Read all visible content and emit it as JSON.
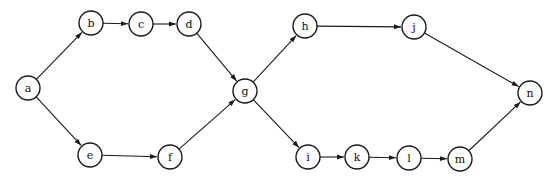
{
  "diagram": {
    "type": "directed-graph",
    "node_radius": 12,
    "nodes": [
      {
        "id": "a",
        "label": "a",
        "x": 28,
        "y": 88
      },
      {
        "id": "b",
        "label": "b",
        "x": 91,
        "y": 23
      },
      {
        "id": "c",
        "label": "c",
        "x": 141,
        "y": 24
      },
      {
        "id": "d",
        "label": "d",
        "x": 189,
        "y": 24
      },
      {
        "id": "e",
        "label": "e",
        "x": 90,
        "y": 155
      },
      {
        "id": "f",
        "label": "f",
        "x": 170,
        "y": 157
      },
      {
        "id": "g",
        "label": "g",
        "x": 245,
        "y": 91
      },
      {
        "id": "h",
        "label": "h",
        "x": 305,
        "y": 26
      },
      {
        "id": "j",
        "label": "j",
        "x": 414,
        "y": 27
      },
      {
        "id": "n",
        "label": "n",
        "x": 530,
        "y": 93
      },
      {
        "id": "i",
        "label": "i",
        "x": 308,
        "y": 157
      },
      {
        "id": "k",
        "label": "k",
        "x": 357,
        "y": 157
      },
      {
        "id": "l",
        "label": "l",
        "x": 409,
        "y": 158
      },
      {
        "id": "m",
        "label": "m",
        "x": 460,
        "y": 159
      }
    ],
    "edges": [
      {
        "from": "a",
        "to": "b"
      },
      {
        "from": "b",
        "to": "c"
      },
      {
        "from": "c",
        "to": "d"
      },
      {
        "from": "d",
        "to": "g"
      },
      {
        "from": "a",
        "to": "e"
      },
      {
        "from": "e",
        "to": "f"
      },
      {
        "from": "f",
        "to": "g"
      },
      {
        "from": "g",
        "to": "h"
      },
      {
        "from": "h",
        "to": "j"
      },
      {
        "from": "j",
        "to": "n"
      },
      {
        "from": "g",
        "to": "i"
      },
      {
        "from": "i",
        "to": "k"
      },
      {
        "from": "k",
        "to": "l"
      },
      {
        "from": "l",
        "to": "m"
      },
      {
        "from": "m",
        "to": "n"
      }
    ]
  }
}
